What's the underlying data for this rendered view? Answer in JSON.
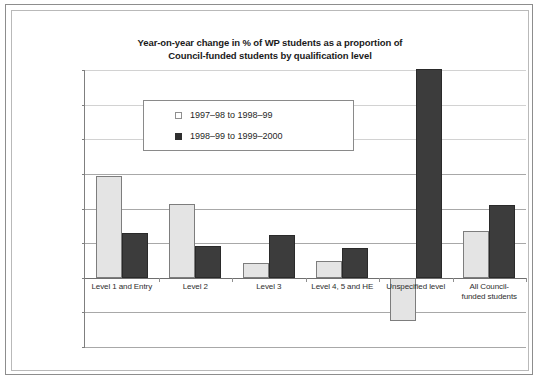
{
  "figure": {
    "title_line1": "Year-on-year change in % of WP students as a proportion of",
    "title_line2": "Council-funded students by qualification level"
  },
  "chart_data": {
    "type": "bar",
    "title": "Year-on-year change in % of WP students as a proportion of Council-funded students by qualification level",
    "xlabel": "",
    "ylabel": "",
    "ylim": [
      -1.0,
      3.0
    ],
    "ytick_step": 0.5,
    "ytick_labels": [
      "3.0%",
      "2.5%",
      "2.0%",
      "1.5%",
      "1.0%",
      "0.5%",
      "0.0%",
      "-0.5%",
      "-1.0%"
    ],
    "ytick_values": [
      3.0,
      2.5,
      2.0,
      1.5,
      1.0,
      0.5,
      0.0,
      -0.5,
      -1.0
    ],
    "grid": true,
    "legend_position": "upper-left-inside",
    "units": "percent",
    "categories": [
      "Level 1 and Entry",
      "Level 2",
      "Level 3",
      "Level 4, 5 and HE",
      "Unspecified level",
      "All Council-funded students"
    ],
    "category_labels": [
      [
        "Level 1 and Entry"
      ],
      [
        "Level 2"
      ],
      [
        "Level 3"
      ],
      [
        "Level 4, 5 and HE"
      ],
      [
        "Unspecified level"
      ],
      [
        "All Council-",
        "funded students"
      ]
    ],
    "series": [
      {
        "name": "1997–98 to 1998–99",
        "color": "#e4e4e4",
        "values": [
          1.47,
          1.07,
          0.21,
          0.24,
          -0.62,
          0.67
        ]
      },
      {
        "name": "1998–99 to 1999–2000",
        "color": "#3c3c3c",
        "values": [
          0.65,
          0.46,
          0.62,
          0.43,
          3.02,
          1.05
        ]
      }
    ]
  }
}
